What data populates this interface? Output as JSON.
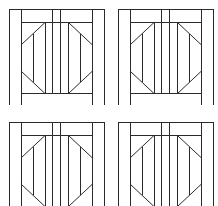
{
  "figure": {
    "layout": {
      "columns": 2,
      "rows": 2
    },
    "stroke_color": "#2b2b2b",
    "background_color": "#ffffff",
    "panels": [
      {
        "id": "panel-1",
        "position": "top-left",
        "x": 9,
        "y": 9
      },
      {
        "id": "panel-2",
        "position": "top-right",
        "x": 118,
        "y": 9
      },
      {
        "id": "panel-3",
        "position": "bottom-left",
        "x": 9,
        "y": 122
      },
      {
        "id": "panel-4",
        "position": "bottom-right",
        "x": 118,
        "y": 122
      }
    ]
  }
}
